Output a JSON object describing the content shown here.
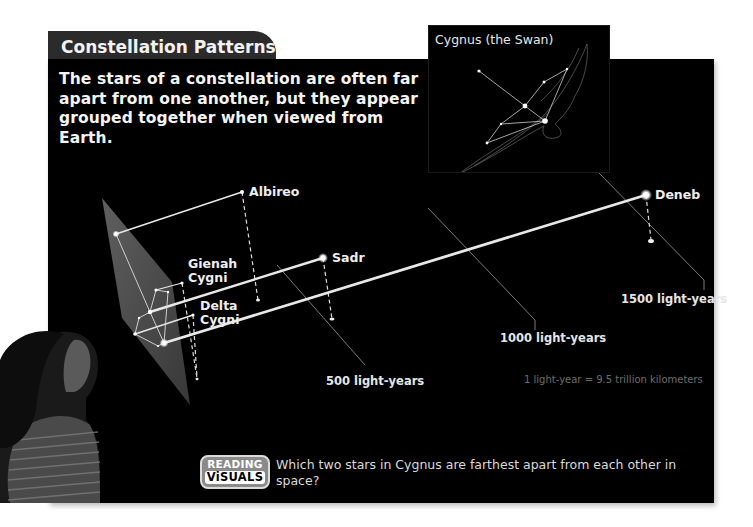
{
  "header": {
    "title": "Constellation Patterns",
    "intro": "The stars of a constellation are often far apart from one another, but they appear grouped together when viewed from Earth."
  },
  "inset": {
    "title": "Cygnus (the Swan)"
  },
  "stars": [
    {
      "name": "Albireo"
    },
    {
      "name": "Gienah Cygni",
      "line1": "Gienah",
      "line2": "Cygni"
    },
    {
      "name": "Delta Cygni",
      "line1": "Delta",
      "line2": "Cygni"
    },
    {
      "name": "Sadr"
    },
    {
      "name": "Deneb"
    }
  ],
  "distance_markers": [
    {
      "label": "500 light-years"
    },
    {
      "label": "1000 light-years"
    },
    {
      "label": "1500 light-years"
    }
  ],
  "note": "1 light-year = 9.5 trillion kilometers",
  "reading_visuals": {
    "badge_top": "READING",
    "badge_bottom": "ViSUALS",
    "question": "Which two stars in Cygnus are farthest apart from each other in space?"
  },
  "colors": {
    "panel_bg": "#000000",
    "title_tab_bg": "#2b2b2b",
    "plane_fill": "#5a5a5a",
    "badge_gray": "#8a8a8a"
  }
}
